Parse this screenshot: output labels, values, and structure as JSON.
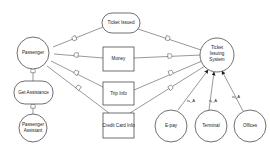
{
  "diagram": {
    "type": "context-diagram",
    "nodes": {
      "passenger": {
        "label": "Passenger",
        "shape": "circle"
      },
      "ticket_issued": {
        "label": "Ticket Issued",
        "shape": "rounded-rect"
      },
      "money": {
        "label": "Money",
        "shape": "rect"
      },
      "trip_info": {
        "label": "Trip Info",
        "shape": "rect"
      },
      "credit_card_info": {
        "label": "Credit Card Info",
        "shape": "rect"
      },
      "ticket_issuing_system": {
        "label_lines": [
          "Ticket",
          "Issuing",
          "System"
        ],
        "shape": "circle"
      },
      "get_assistance": {
        "label": "Get Assistance",
        "shape": "rounded-rect"
      },
      "passenger_assistant": {
        "label_lines": [
          "Passenger",
          "Assistant"
        ],
        "shape": "circle"
      },
      "e_pay": {
        "label": "E-pay",
        "shape": "circle"
      },
      "terminal": {
        "label": "Terminal",
        "shape": "circle"
      },
      "offices": {
        "label": "Offices",
        "shape": "circle"
      }
    },
    "edges": [
      {
        "from": "passenger",
        "to": "ticket_issued",
        "marker": "flow-symbol"
      },
      {
        "from": "passenger",
        "to": "money",
        "marker": "flow-symbol"
      },
      {
        "from": "passenger",
        "to": "trip_info",
        "marker": "flow-symbol"
      },
      {
        "from": "passenger",
        "to": "credit_card_info",
        "marker": "flow-symbol"
      },
      {
        "from": "ticket_issued",
        "to": "ticket_issuing_system",
        "marker": "flow-symbol"
      },
      {
        "from": "money",
        "to": "ticket_issuing_system",
        "marker": "flow-symbol"
      },
      {
        "from": "trip_info",
        "to": "ticket_issuing_system",
        "marker": "flow-symbol"
      },
      {
        "from": "credit_card_info",
        "to": "ticket_issuing_system",
        "marker": "flow-symbol"
      },
      {
        "from": "passenger",
        "to": "get_assistance",
        "marker": "flow-symbol"
      },
      {
        "from": "get_assistance",
        "to": "passenger_assistant",
        "marker": "flow-symbol"
      },
      {
        "from": "e_pay",
        "to": "ticket_issuing_system",
        "label": "is_A",
        "marker": "arrow"
      },
      {
        "from": "terminal",
        "to": "ticket_issuing_system",
        "label": "is_A",
        "marker": "arrow"
      },
      {
        "from": "offices",
        "to": "ticket_issuing_system",
        "label": "is_A",
        "marker": "arrow"
      }
    ],
    "edge_labels": {
      "e_pay": "is_A",
      "terminal": "is_A",
      "offices": "is_A"
    }
  }
}
